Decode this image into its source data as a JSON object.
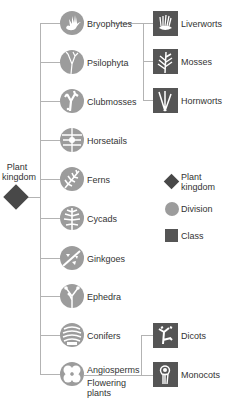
{
  "colors": {
    "division": "#9c9c9c",
    "class": "#555555",
    "kingdom": "#484848",
    "connector": "#b3b3b3",
    "text": "#333333"
  },
  "root": {
    "label_line1": "Plant",
    "label_line2": "kingdom"
  },
  "divisions": [
    {
      "label": "Bryophytes",
      "icon": "hand-moss-icon"
    },
    {
      "label": "Psilophyta",
      "icon": "forked-stem-icon"
    },
    {
      "label": "Clubmosses",
      "icon": "clubmoss-icon"
    },
    {
      "label": "Horsetails",
      "icon": "horsetail-icon"
    },
    {
      "label": "Ferns",
      "icon": "fern-frond-icon"
    },
    {
      "label": "Cycads",
      "icon": "cycad-leaf-icon"
    },
    {
      "label": "Ginkgoes",
      "icon": "ginkgo-icon"
    },
    {
      "label": "Ephedra",
      "icon": "ephedra-icon"
    },
    {
      "label": "Conifers",
      "icon": "cone-icon"
    },
    {
      "label": "Angiosperms",
      "icon": "flower-icon",
      "sublabel_line1": "Flowering",
      "sublabel_line2": "plants"
    }
  ],
  "bryophyte_classes": [
    {
      "label": "Liverworts",
      "icon": "liverwort-icon"
    },
    {
      "label": "Mosses",
      "icon": "moss-icon"
    },
    {
      "label": "Hornworts",
      "icon": "hornwort-icon"
    }
  ],
  "angiosperm_classes": [
    {
      "label": "Dicots",
      "icon": "dicot-icon"
    },
    {
      "label": "Monocots",
      "icon": "monocot-icon"
    }
  ],
  "legend": {
    "kingdom_line1": "Plant",
    "kingdom_line2": "kingdom",
    "division": "Division",
    "class": "Class"
  }
}
